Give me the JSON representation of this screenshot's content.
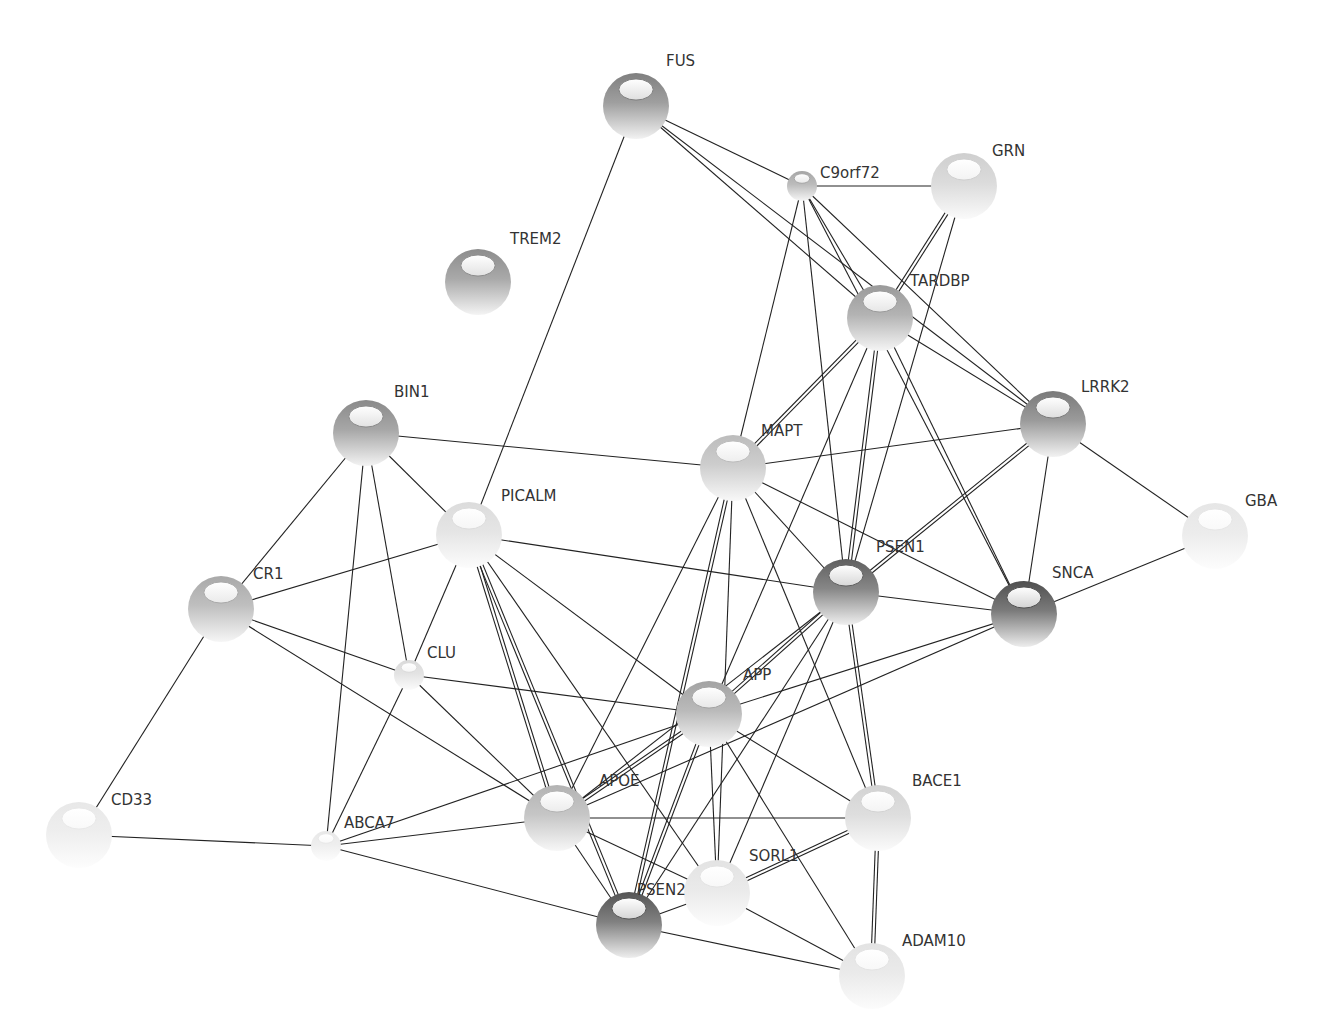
{
  "diagram": {
    "type": "protein-interaction-network",
    "nodes": [
      {
        "id": "FUS",
        "label": "FUS",
        "shade": "#7f7f7f",
        "size": "large"
      },
      {
        "id": "C9orf72",
        "label": "C9orf72",
        "shade": "#a6a6a6",
        "size": "small"
      },
      {
        "id": "GRN",
        "label": "GRN",
        "shade": "#cfcfcf",
        "size": "large"
      },
      {
        "id": "TREM2",
        "label": "TREM2",
        "shade": "#8c8c8c",
        "size": "large"
      },
      {
        "id": "TARDBP",
        "label": "TARDBP",
        "shade": "#9a9a9a",
        "size": "large"
      },
      {
        "id": "BIN1",
        "label": "BIN1",
        "shade": "#8a8a8a",
        "size": "large"
      },
      {
        "id": "MAPT",
        "label": "MAPT",
        "shade": "#bcbcbc",
        "size": "large"
      },
      {
        "id": "LRRK2",
        "label": "LRRK2",
        "shade": "#7a7a7a",
        "size": "large"
      },
      {
        "id": "PICALM",
        "label": "PICALM",
        "shade": "#dcdcdc",
        "size": "large"
      },
      {
        "id": "GBA",
        "label": "GBA",
        "shade": "#e6e6e6",
        "size": "large"
      },
      {
        "id": "CR1",
        "label": "CR1",
        "shade": "#a9a9a9",
        "size": "large"
      },
      {
        "id": "PSEN1",
        "label": "PSEN1",
        "shade": "#5f5f5f",
        "size": "large"
      },
      {
        "id": "SNCA",
        "label": "SNCA",
        "shade": "#4f4f4f",
        "size": "large"
      },
      {
        "id": "CLU",
        "label": "CLU",
        "shade": "#dadada",
        "size": "small"
      },
      {
        "id": "APP",
        "label": "APP",
        "shade": "#a3a3a3",
        "size": "large"
      },
      {
        "id": "CD33",
        "label": "CD33",
        "shade": "#e8e8e8",
        "size": "large"
      },
      {
        "id": "ABCA7",
        "label": "ABCA7",
        "shade": "#e8e8e8",
        "size": "small"
      },
      {
        "id": "APOE",
        "label": "APOE",
        "shade": "#b3b3b3",
        "size": "large"
      },
      {
        "id": "BACE1",
        "label": "BACE1",
        "shade": "#d3d3d3",
        "size": "large"
      },
      {
        "id": "SORL1",
        "label": "SORL1",
        "shade": "#e3e3e3",
        "size": "large"
      },
      {
        "id": "PSEN2",
        "label": "PSEN2",
        "shade": "#555555",
        "size": "large"
      },
      {
        "id": "ADAM10",
        "label": "ADAM10",
        "shade": "#e3e3e3",
        "size": "large"
      }
    ],
    "edges": [
      [
        "FUS",
        "C9orf72",
        1
      ],
      [
        "FUS",
        "TARDBP",
        1
      ],
      [
        "FUS",
        "PICALM",
        1
      ],
      [
        "FUS",
        "LRRK2",
        1
      ],
      [
        "C9orf72",
        "GRN",
        1
      ],
      [
        "C9orf72",
        "TARDBP",
        1
      ],
      [
        "C9orf72",
        "MAPT",
        1
      ],
      [
        "C9orf72",
        "PSEN1",
        1
      ],
      [
        "C9orf72",
        "LRRK2",
        1
      ],
      [
        "C9orf72",
        "SNCA",
        1
      ],
      [
        "GRN",
        "TARDBP",
        2
      ],
      [
        "GRN",
        "PSEN1",
        1
      ],
      [
        "TARDBP",
        "MAPT",
        2
      ],
      [
        "TARDBP",
        "LRRK2",
        1
      ],
      [
        "TARDBP",
        "PSEN1",
        2
      ],
      [
        "TARDBP",
        "SNCA",
        1
      ],
      [
        "TARDBP",
        "APP",
        1
      ],
      [
        "BIN1",
        "MAPT",
        1
      ],
      [
        "BIN1",
        "PICALM",
        1
      ],
      [
        "BIN1",
        "CR1",
        1
      ],
      [
        "BIN1",
        "CLU",
        1
      ],
      [
        "BIN1",
        "ABCA7",
        1
      ],
      [
        "MAPT",
        "LRRK2",
        1
      ],
      [
        "MAPT",
        "PSEN1",
        1
      ],
      [
        "MAPT",
        "SNCA",
        1
      ],
      [
        "MAPT",
        "APOE",
        1
      ],
      [
        "MAPT",
        "PSEN2",
        2
      ],
      [
        "MAPT",
        "SORL1",
        1
      ],
      [
        "MAPT",
        "BACE1",
        1
      ],
      [
        "LRRK2",
        "PSEN1",
        2
      ],
      [
        "LRRK2",
        "SNCA",
        1
      ],
      [
        "LRRK2",
        "GBA",
        1
      ],
      [
        "PICALM",
        "CR1",
        1
      ],
      [
        "PICALM",
        "CLU",
        1
      ],
      [
        "PICALM",
        "PSEN1",
        1
      ],
      [
        "PICALM",
        "APOE",
        2
      ],
      [
        "PICALM",
        "APP",
        1
      ],
      [
        "PICALM",
        "PSEN2",
        2
      ],
      [
        "PICALM",
        "SORL1",
        1
      ],
      [
        "GBA",
        "SNCA",
        1
      ],
      [
        "CR1",
        "CLU",
        1
      ],
      [
        "CR1",
        "APOE",
        1
      ],
      [
        "CR1",
        "CD33",
        1
      ],
      [
        "PSEN1",
        "SNCA",
        1
      ],
      [
        "PSEN1",
        "APP",
        2
      ],
      [
        "PSEN1",
        "APOE",
        1
      ],
      [
        "PSEN1",
        "PSEN2",
        1
      ],
      [
        "PSEN1",
        "BACE1",
        2
      ],
      [
        "PSEN1",
        "SORL1",
        1
      ],
      [
        "SNCA",
        "APP",
        1
      ],
      [
        "SNCA",
        "APOE",
        1
      ],
      [
        "CLU",
        "APP",
        1
      ],
      [
        "CLU",
        "ABCA7",
        1
      ],
      [
        "CLU",
        "APOE",
        1
      ],
      [
        "APP",
        "APOE",
        2
      ],
      [
        "APP",
        "BACE1",
        1
      ],
      [
        "APP",
        "SORL1",
        1
      ],
      [
        "APP",
        "PSEN2",
        2
      ],
      [
        "APP",
        "ADAM10",
        1
      ],
      [
        "APP",
        "ABCA7",
        1
      ],
      [
        "CD33",
        "ABCA7",
        1
      ],
      [
        "ABCA7",
        "APOE",
        1
      ],
      [
        "ABCA7",
        "PSEN2",
        1
      ],
      [
        "APOE",
        "BACE1",
        1
      ],
      [
        "APOE",
        "SORL1",
        1
      ],
      [
        "APOE",
        "PSEN2",
        1
      ],
      [
        "BACE1",
        "SORL1",
        2
      ],
      [
        "BACE1",
        "ADAM10",
        2
      ],
      [
        "SORL1",
        "PSEN2",
        1
      ],
      [
        "SORL1",
        "ADAM10",
        1
      ],
      [
        "PSEN2",
        "ADAM10",
        1
      ]
    ]
  }
}
